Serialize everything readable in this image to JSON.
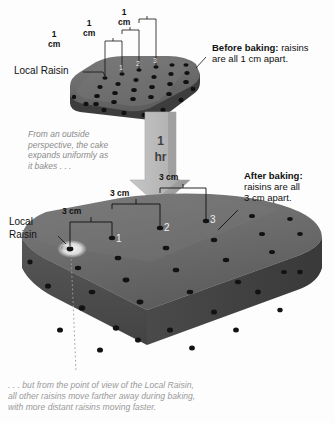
{
  "figure": {
    "title_top_right_bold": "Before baking:",
    "title_top_right_rest": " raisins",
    "title_top_right_line2": "are all 1 cm apart.",
    "title_bottom_right_bold": "After baking:",
    "title_bottom_right_line2": "raisins are all",
    "title_bottom_right_line3": "3 cm apart.",
    "local_raisin_top": "Local Raisin",
    "local_raisin_bottom_line1": "Local",
    "local_raisin_bottom_line2": "Raisin",
    "arrow_label_line1": "1",
    "arrow_label_line2": "hr",
    "side_note_line1": "From an outside",
    "side_note_line2": "perspective, the cake",
    "side_note_line3": "expands uniformly as",
    "side_note_line4": "it bakes . . .",
    "bottom_note_line1": ". . . but from the point of view of the Local Raisin,",
    "bottom_note_line2": "all other raisins move farther away during baking,",
    "bottom_note_line3": "with more distant raisins moving faster."
  },
  "measurements_before": [
    {
      "value": "1",
      "unit": "cm"
    },
    {
      "value": "1",
      "unit": "cm"
    },
    {
      "value": "1",
      "unit": "cm"
    }
  ],
  "measurements_after": [
    {
      "label": "3 cm"
    },
    {
      "label": "3 cm"
    },
    {
      "label": "3 cm"
    }
  ],
  "raisin_numbers_before": [
    "1",
    "2",
    "3"
  ],
  "raisin_numbers_after": [
    "1",
    "2",
    "3"
  ],
  "colors": {
    "background": "#fdfdfd",
    "cake_top": "#6d6d6d",
    "cake_front": "#4c4c4c",
    "cake_side": "#3f3f3f",
    "raisin": "#121212",
    "arrow_fill": "#b9b9b9",
    "arrow_shade": "#8e8e8e",
    "note_gray": "#9a9a9a",
    "leader_line": "#1a1a1a"
  }
}
